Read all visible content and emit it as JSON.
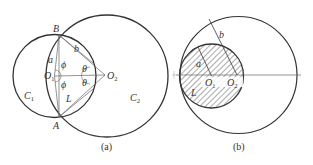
{
  "figure": {
    "panel_a": {
      "caption": "(a)",
      "labels": {
        "B": "B",
        "A": "A",
        "a": "a",
        "b": "b",
        "phi_top": "ϕ",
        "phi_bottom": "ϕ",
        "theta_top": "θ",
        "theta_bottom": "θ",
        "O1": "O",
        "O1_sub": "1",
        "O2": "O",
        "O2_sub": "2",
        "L": "L",
        "C1": "C",
        "C1_sub": "1",
        "C2": "C",
        "C2_sub": "2"
      }
    },
    "panel_b": {
      "caption": "(b)",
      "labels": {
        "a": "a",
        "b": "b",
        "L": "L",
        "O1": "O",
        "O1_sub": "1",
        "O2": "O",
        "O2_sub": "2"
      }
    },
    "colors": {
      "stroke": "#333333",
      "thin": "#666666",
      "hatch": "#444444"
    }
  }
}
